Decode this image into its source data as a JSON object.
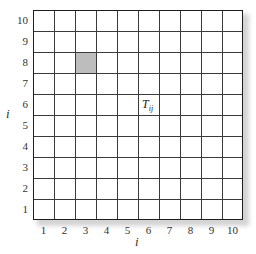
{
  "diagram": {
    "grid": {
      "rows": 10,
      "cols": 10,
      "line_color": "#3a3a3a",
      "border_color": "#1e1e1e",
      "background": "#ffffff"
    },
    "y_axis": {
      "label": "i",
      "ticks": [
        "1",
        "2",
        "3",
        "4",
        "5",
        "6",
        "7",
        "8",
        "9",
        "10"
      ]
    },
    "x_axis": {
      "label": "i",
      "ticks": [
        "1",
        "2",
        "3",
        "4",
        "5",
        "6",
        "7",
        "8",
        "9",
        "10"
      ]
    },
    "highlighted_cell": {
      "col": 3,
      "row": 8,
      "color": "#bdbdbd"
    },
    "cell_annotation": {
      "main": "T",
      "subscript": "ij",
      "col": 6,
      "row": 6
    }
  }
}
